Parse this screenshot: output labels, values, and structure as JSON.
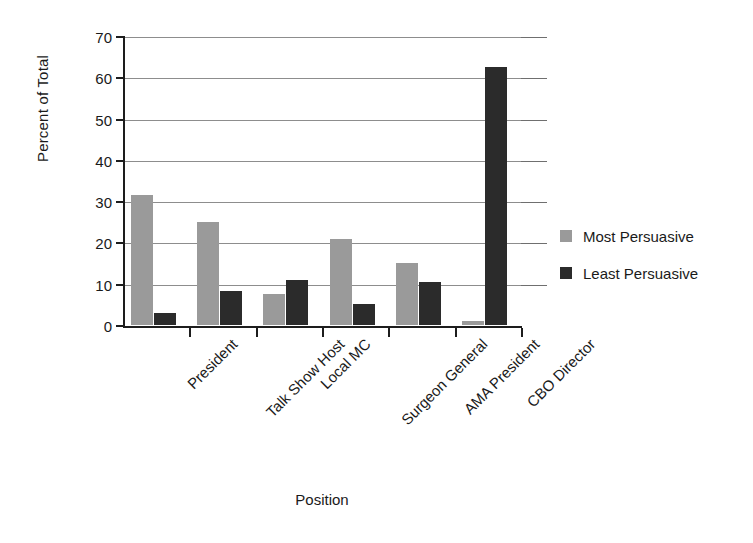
{
  "chart_data": {
    "type": "bar",
    "title": "",
    "subtitle": "",
    "xlabel": "Position",
    "ylabel": "Percent of Total",
    "ylim": [
      0,
      70
    ],
    "ytick_step": 10,
    "yticks": [
      0,
      10,
      20,
      30,
      40,
      50,
      60,
      70
    ],
    "grid": true,
    "legend_position": "right",
    "categories": [
      "President",
      "Talk Show Host",
      "Local MC",
      "Surgeon General",
      "AMA President",
      "CBO Director"
    ],
    "series": [
      {
        "name": "Most Persuasive",
        "color": "#9a9a9a",
        "values": [
          31.5,
          25.0,
          7.5,
          20.8,
          15.0,
          1.0
        ]
      },
      {
        "name": "Least Persuasive",
        "color": "#2b2b2b",
        "values": [
          3.0,
          8.3,
          11.0,
          5.2,
          10.5,
          62.5
        ]
      }
    ]
  },
  "legend": {
    "items": [
      {
        "label": "Most Persuasive"
      },
      {
        "label": "Least Persuasive"
      }
    ]
  },
  "axes": {
    "y_title": "Percent of Total",
    "x_title": "Position",
    "y_tick_labels": [
      "0",
      "10",
      "20",
      "30",
      "40",
      "50",
      "60",
      "70"
    ]
  },
  "colors": {
    "most_persuasive": "#9a9a9a",
    "least_persuasive": "#2b2b2b",
    "axis": "#1d1d1d",
    "gridline": "#8d8d8d",
    "background": "#ffffff"
  }
}
